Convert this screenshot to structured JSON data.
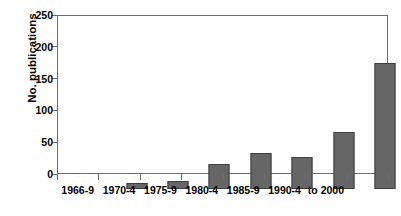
{
  "chart_data": {
    "type": "bar",
    "title": "",
    "xlabel": "",
    "ylabel": "No. publications",
    "categories": [
      "1966-9",
      "1970-4",
      "1975-9",
      "1980-4",
      "1985-9",
      "1990-4",
      "to 2000"
    ],
    "values": [
      10,
      12,
      40,
      57,
      50,
      89,
      198
    ],
    "ylim": [
      0,
      250
    ],
    "yticks": [
      0,
      50,
      100,
      150,
      200,
      250
    ],
    "ytick_labels": [
      "0",
      "50",
      "100",
      "150",
      "200",
      "250"
    ],
    "grid": false,
    "legend": false,
    "bar_color": "#666666",
    "bar_edge_color": "#3f3f3f",
    "axis_color": "#6d6d6d",
    "background": "#ffffff",
    "empty_trailing_slot": true,
    "n_slots": 8
  }
}
